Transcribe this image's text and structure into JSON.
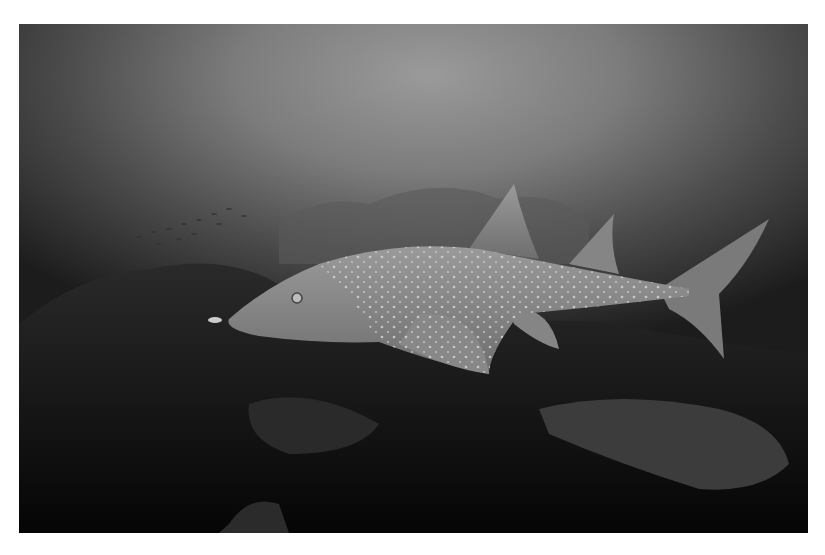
{
  "image": {
    "description": "Grayscale underwater photograph of a spotted shark ray (guitarfish) swimming over a dark coral reef, with a school of small fish in the hazy water to the upper left",
    "subject": "shark ray",
    "palette": {
      "water_top": "#9a9a9a",
      "water_mid": "#5a5a5a",
      "reef": "#111111",
      "ray_body": "#8a8a8a",
      "spots": "#d8d8d8",
      "border": "#ffffff"
    }
  }
}
